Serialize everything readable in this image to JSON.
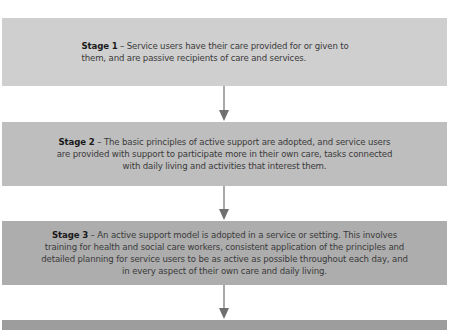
{
  "diagram": {
    "type": "flowchart",
    "direction": "top-to-bottom",
    "stages": [
      {
        "label": "Stage 1",
        "separator": " – ",
        "text": "Service users have their care provided for or given to them, and are passive recipients of care and services.",
        "color": "#cfcfcf"
      },
      {
        "label": "Stage 2",
        "separator": " – ",
        "text": "The basic principles of active support are adopted, and service users are provided with support to participate more in their own care, tasks connected with daily living and activities that interest them.",
        "color": "#bebebe"
      },
      {
        "label": "Stage 3",
        "separator": " – ",
        "text": "An active support model is adopted in a service or setting. This involves training for health and social care workers, consistent application of the principles and detailed planning for service users to be as active as possible throughout each day, and in every aspect of their own care and daily living.",
        "color": "#adadad"
      },
      {
        "label": "",
        "text": "",
        "color": "#9d9d9d"
      }
    ],
    "arrows": [
      {
        "from": "Stage 1",
        "to": "Stage 2",
        "icon": "down-arrow-icon"
      },
      {
        "from": "Stage 2",
        "to": "Stage 3",
        "icon": "down-arrow-icon"
      },
      {
        "from": "Stage 3",
        "to": "Stage 4",
        "icon": "down-arrow-icon"
      }
    ],
    "arrow_color": "#6f6f6f"
  }
}
